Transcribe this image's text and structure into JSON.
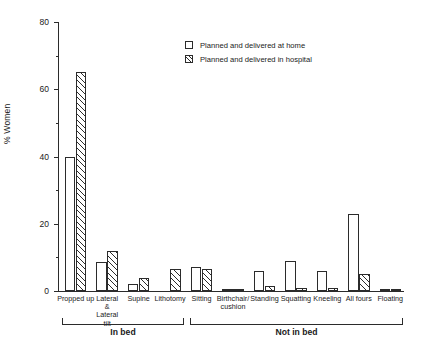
{
  "chart_data": {
    "type": "bar",
    "title": "",
    "xlabel": "",
    "ylabel": "% Women",
    "ylim": [
      0,
      80
    ],
    "yticks": [
      0,
      20,
      40,
      60,
      80
    ],
    "grid": false,
    "legend_position": "top-center",
    "categories": [
      "Propped up",
      "Lateral & Lateral tilt",
      "Supine",
      "Lithotomy",
      "Sitting",
      "Birthchair/ cushion",
      "Standing",
      "Squatting",
      "Kneeling",
      "All fours",
      "Floating"
    ],
    "series": [
      {
        "name": "Planned and delivered at home",
        "fill": "open",
        "values": [
          40,
          8.5,
          2,
          0,
          7,
          0.6,
          6,
          9,
          6,
          23,
          0.5
        ]
      },
      {
        "name": "Planned and delivered in hospital",
        "fill": "hatched",
        "values": [
          65,
          12,
          4,
          6.5,
          6.5,
          0.5,
          1.5,
          1,
          1,
          5,
          0.5
        ]
      }
    ],
    "groups": [
      {
        "label": "In bed",
        "categories": [
          "Propped up",
          "Lateral & Lateral tilt",
          "Supine",
          "Lithotomy"
        ]
      },
      {
        "label": "Not in bed",
        "categories": [
          "Sitting",
          "Birthchair/ cushion",
          "Standing",
          "Squatting",
          "Kneeling",
          "All fours",
          "Floating"
        ]
      }
    ]
  },
  "axis": {
    "y_title": "% Women",
    "y_tick_labels": [
      "80",
      "60",
      "40",
      "20",
      "0"
    ]
  },
  "legend": {
    "items": [
      {
        "label": "Planned and delivered at home",
        "style": "open"
      },
      {
        "label": "Planned and delivered in hospital",
        "style": "hatched"
      }
    ]
  },
  "category_labels": [
    {
      "line1": "Propped up",
      "line2": "",
      "line3": "",
      "line4": ""
    },
    {
      "line1": "Lateral",
      "line2": "&",
      "line3": "Lateral",
      "line4": "tilt"
    },
    {
      "line1": "Supine",
      "line2": "",
      "line3": "",
      "line4": ""
    },
    {
      "line1": "Lithotomy",
      "line2": "",
      "line3": "",
      "line4": ""
    },
    {
      "line1": "Sitting",
      "line2": "",
      "line3": "",
      "line4": ""
    },
    {
      "line1": "Birthchair/",
      "line2": "cushion",
      "line3": "",
      "line4": ""
    },
    {
      "line1": "Standing",
      "line2": "",
      "line3": "",
      "line4": ""
    },
    {
      "line1": "Squatting",
      "line2": "",
      "line3": "",
      "line4": ""
    },
    {
      "line1": "Kneeling",
      "line2": "",
      "line3": "",
      "line4": ""
    },
    {
      "line1": "All fours",
      "line2": "",
      "line3": "",
      "line4": ""
    },
    {
      "line1": "Floating",
      "line2": "",
      "line3": "",
      "line4": ""
    }
  ],
  "group_labels": {
    "in_bed": "In bed",
    "not_in_bed": "Not in bed"
  },
  "colors": {
    "ink": "#2b2b2b",
    "background": "#ffffff"
  }
}
